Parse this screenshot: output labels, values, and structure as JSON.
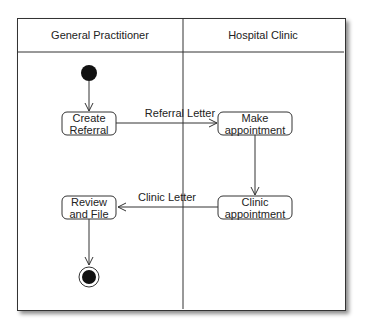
{
  "diagram": {
    "type": "uml-activity-swimlane",
    "lanes": [
      {
        "label": "General Practitioner"
      },
      {
        "label": "Hospital Clinic"
      }
    ],
    "activities": [
      {
        "id": "create_referral",
        "lines": [
          "Create",
          "Referral"
        ],
        "lane": 0
      },
      {
        "id": "make_appointment",
        "lines": [
          "Make",
          "appointment"
        ],
        "lane": 1
      },
      {
        "id": "clinic_appointment",
        "lines": [
          "Clinic",
          "appointment"
        ],
        "lane": 1
      },
      {
        "id": "review_file",
        "lines": [
          "Review",
          "and File"
        ],
        "lane": 0
      }
    ],
    "flows": [
      {
        "from": "start",
        "to": "create_referral",
        "label": ""
      },
      {
        "from": "create_referral",
        "to": "make_appointment",
        "label": "Referral Letter"
      },
      {
        "from": "make_appointment",
        "to": "clinic_appointment",
        "label": ""
      },
      {
        "from": "clinic_appointment",
        "to": "review_file",
        "label": "Clinic Letter"
      },
      {
        "from": "review_file",
        "to": "end",
        "label": ""
      }
    ]
  }
}
